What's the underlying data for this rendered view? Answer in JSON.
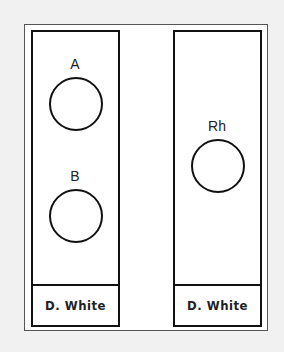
{
  "panels": [
    {
      "wells": [
        {
          "label": "A"
        },
        {
          "label": "B"
        }
      ],
      "footer": "D. White"
    },
    {
      "wells": [
        {
          "label": "Rh"
        }
      ],
      "footer": "D. White"
    }
  ]
}
